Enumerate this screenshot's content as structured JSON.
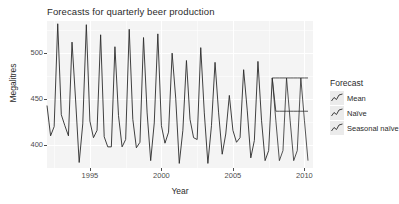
{
  "chart_data": {
    "type": "line",
    "title": "Forecasts for quarterly beer production",
    "xlabel": "Year",
    "ylabel": "Megalitres",
    "xlim": [
      1992.0,
      2010.6
    ],
    "ylim": [
      375,
      535
    ],
    "xticks": [
      1995,
      2000,
      2005,
      2010
    ],
    "xtick_labels": [
      "1995",
      "2000",
      "2005",
      "2010"
    ],
    "yticks": [
      400,
      450,
      500
    ],
    "ytick_labels": [
      "400",
      "450",
      "500"
    ],
    "grid": true,
    "legend_position": "right",
    "legend_title": "Forecast",
    "series": [
      {
        "name": "Observed",
        "x": [
          1992.0,
          1992.25,
          1992.5,
          1992.75,
          1993.0,
          1993.25,
          1993.5,
          1993.75,
          1994.0,
          1994.25,
          1994.5,
          1994.75,
          1995.0,
          1995.25,
          1995.5,
          1995.75,
          1996.0,
          1996.25,
          1996.5,
          1996.75,
          1997.0,
          1997.25,
          1997.5,
          1997.75,
          1998.0,
          1998.25,
          1998.5,
          1998.75,
          1999.0,
          1999.25,
          1999.5,
          1999.75,
          2000.0,
          2000.25,
          2000.5,
          2000.75,
          2001.0,
          2001.25,
          2001.5,
          2001.75,
          2002.0,
          2002.25,
          2002.5,
          2002.75,
          2003.0,
          2003.25,
          2003.5,
          2003.75,
          2004.0,
          2004.25,
          2004.5,
          2004.75,
          2005.0,
          2005.25,
          2005.5,
          2005.75,
          2006.0,
          2006.25,
          2006.5,
          2006.75,
          2007.0,
          2007.25,
          2007.5,
          2007.75
        ],
        "y": [
          443,
          410,
          420,
          532,
          433,
          421,
          410,
          512,
          449,
          381,
          423,
          531,
          426,
          408,
          416,
          520,
          409,
          398,
          398,
          507,
          432,
          398,
          406,
          526,
          428,
          397,
          403,
          517,
          435,
          383,
          424,
          521,
          421,
          402,
          414,
          500,
          451,
          380,
          416,
          492,
          428,
          408,
          406,
          506,
          435,
          380,
          421,
          490,
          435,
          390,
          412,
          454,
          416,
          403,
          408,
          482,
          438,
          386,
          405,
          491,
          427,
          383,
          394,
          473
        ]
      },
      {
        "name": "Mean",
        "x": [
          2007.75,
          2008.0,
          2008.25,
          2008.5,
          2008.75,
          2009.0,
          2009.25,
          2009.5,
          2009.75,
          2010.0,
          2010.25
        ],
        "y": [
          473,
          436.8,
          436.8,
          436.8,
          436.8,
          436.8,
          436.8,
          436.8,
          436.8,
          436.8,
          436.8
        ],
        "constant": 436.8
      },
      {
        "name": "Naive",
        "x": [
          2007.75,
          2008.0,
          2008.25,
          2008.5,
          2008.75,
          2009.0,
          2009.25,
          2009.5,
          2009.75,
          2010.0,
          2010.25
        ],
        "y": [
          473,
          473,
          473,
          473,
          473,
          473,
          473,
          473,
          473,
          473,
          473
        ],
        "constant": 473
      },
      {
        "name": "Seasonal naive",
        "x": [
          2007.75,
          2008.0,
          2008.25,
          2008.5,
          2008.75,
          2009.0,
          2009.25,
          2009.5,
          2009.75,
          2010.0,
          2010.25
        ],
        "y": [
          473,
          427,
          383,
          394,
          473,
          427,
          383,
          394,
          473,
          427,
          383
        ]
      }
    ],
    "legend_entries": [
      {
        "label": "Mean",
        "icon": "line-glyph-icon"
      },
      {
        "label": "Naïve",
        "icon": "line-glyph-icon"
      },
      {
        "label": "Seasonal naïve",
        "icon": "line-glyph-icon"
      }
    ],
    "colors": {
      "panel_background": "#f4f4f4",
      "gridline": "#ffffff",
      "series_line": "#2b2b2b",
      "text": "#2b2b2b",
      "tick_text": "#4d4d4d",
      "legend_key_background": "#ebebeb"
    }
  }
}
